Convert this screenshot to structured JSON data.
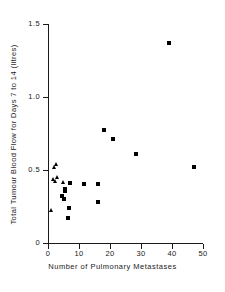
{
  "chart_data": {
    "type": "scatter",
    "title": "",
    "xlabel": "Number of Pulmonary Metastases",
    "ylabel": "Total Tumour Blood Flow for Days 7 to 14 (litres)",
    "xlim": [
      0,
      50
    ],
    "ylim": [
      0,
      1.5
    ],
    "xticks": [
      0,
      10,
      20,
      30,
      40,
      50
    ],
    "xticklabels": [
      "0",
      "10",
      "20",
      "30",
      "40",
      "50"
    ],
    "yticks": [
      0,
      0.5,
      1.0,
      1.5
    ],
    "yticklabels": [
      "0",
      "0.5",
      "1.0",
      "1.5"
    ],
    "grid": false,
    "legend": false,
    "series": [
      {
        "name": "triangle-marker-group",
        "marker": "triangle",
        "color": "#000000",
        "points": [
          {
            "x": 2.0,
            "y": 0.515
          },
          {
            "x": 2.6,
            "y": 0.535
          },
          {
            "x": 1.9,
            "y": 0.435
          },
          {
            "x": 2.4,
            "y": 0.415
          },
          {
            "x": 3.0,
            "y": 0.445
          },
          {
            "x": 5.0,
            "y": 0.41
          },
          {
            "x": 1.0,
            "y": 0.22
          }
        ]
      },
      {
        "name": "square-marker-group",
        "marker": "square",
        "color": "#000000",
        "points": [
          {
            "x": 5.5,
            "y": 0.37
          },
          {
            "x": 5.6,
            "y": 0.355
          },
          {
            "x": 4.6,
            "y": 0.32
          },
          {
            "x": 5.2,
            "y": 0.3
          },
          {
            "x": 7.0,
            "y": 0.41
          },
          {
            "x": 6.6,
            "y": 0.24
          },
          {
            "x": 6.3,
            "y": 0.17
          },
          {
            "x": 11.5,
            "y": 0.405
          },
          {
            "x": 16.0,
            "y": 0.405
          },
          {
            "x": 16.0,
            "y": 0.28
          },
          {
            "x": 18.0,
            "y": 0.775
          },
          {
            "x": 21.0,
            "y": 0.715
          },
          {
            "x": 28.5,
            "y": 0.61
          },
          {
            "x": 39.0,
            "y": 1.37
          },
          {
            "x": 47.0,
            "y": 0.52
          }
        ]
      }
    ]
  },
  "axes": {
    "x_title": "Number of Pulmonary Metastases",
    "y_title": "Total Tumour Blood Flow for Days 7 to 14 (litres)"
  },
  "colors": {
    "marker": "#000000",
    "axis": "#1a1a1a",
    "background": "#ffffff"
  }
}
